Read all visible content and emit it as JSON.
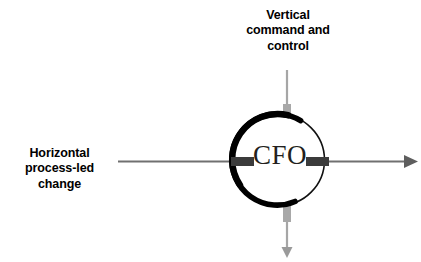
{
  "diagram": {
    "title_hidden": "",
    "center_node": {
      "label": "CFO",
      "shape": "circle",
      "cx": 279,
      "cy": 160,
      "r": 46,
      "stroke_color": "#000000",
      "thick_arc_side": "left",
      "fill": "#ffffff"
    },
    "labels": {
      "vertical": {
        "name": "vertical-axis-label",
        "lines": [
          "Vertical",
          "command and",
          "control"
        ],
        "full_text": "Vertical command and control",
        "color": "#000000",
        "align": "center"
      },
      "horizontal": {
        "name": "horizontal-axis-label",
        "lines": [
          "Horizontal",
          "process-led",
          "change"
        ],
        "full_text": "Horizontal process-led change",
        "color": "#000000",
        "align": "center"
      }
    },
    "arrows": [
      {
        "name": "horizontal-arrow",
        "direction": "right",
        "from": [
          118,
          162
        ],
        "to": [
          414,
          162
        ],
        "color": "#707070",
        "stroke_width": 2.2,
        "arrowhead": true
      },
      {
        "name": "vertical-arrow",
        "direction": "down",
        "from": [
          287,
          70
        ],
        "to": [
          287,
          256
        ],
        "color": "#a6a6a6",
        "stroke_width": 2.2,
        "arrowhead": true
      }
    ],
    "connector_bars": [
      {
        "name": "left-entry-bar",
        "orientation": "horizontal",
        "x": 231,
        "y": 157,
        "width": 22,
        "height": 9,
        "color": "#3b3b3b"
      },
      {
        "name": "right-exit-bar",
        "orientation": "horizontal",
        "x": 307,
        "y": 157,
        "width": 22,
        "height": 9,
        "color": "#3b3b3b"
      },
      {
        "name": "top-entry-bar",
        "orientation": "vertical",
        "x": 283,
        "y": 104,
        "width": 8,
        "height": 36,
        "color": "#a8a8a8"
      },
      {
        "name": "bottom-exit-bar",
        "orientation": "vertical",
        "x": 283,
        "y": 188,
        "width": 8,
        "height": 34,
        "color": "#a8a8a8"
      }
    ],
    "colors": {
      "background": "#ffffff",
      "text": "#000000",
      "center_text": "#231f20",
      "horizontal_arrow": "#707070",
      "vertical_arrow": "#a6a6a6",
      "dark_bar": "#3b3b3b",
      "gray_bar": "#a8a8a8",
      "circle_stroke": "#000000"
    }
  }
}
